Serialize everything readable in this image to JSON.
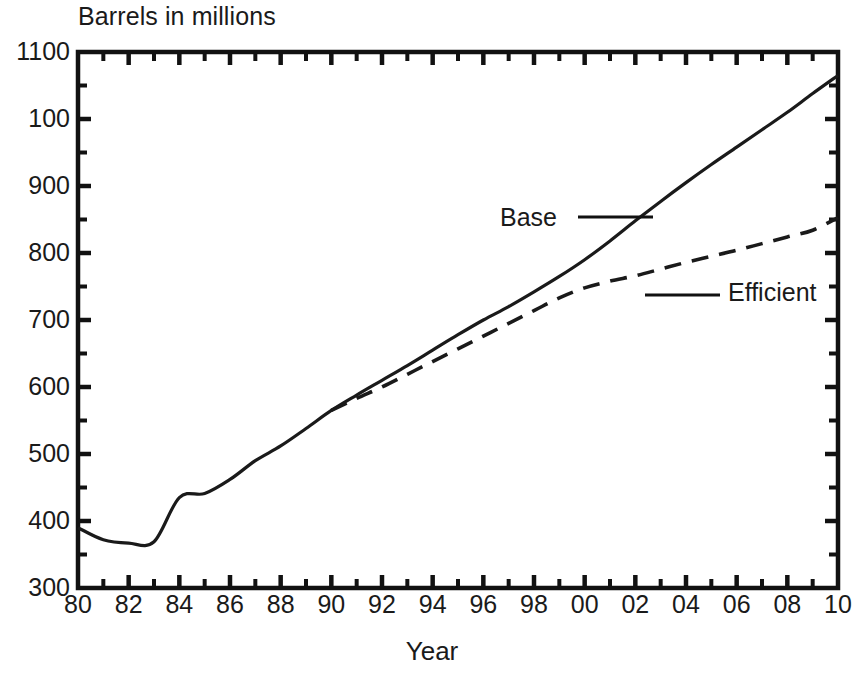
{
  "chart_data": {
    "type": "line",
    "title": "",
    "ylabel": "Barrels in millions",
    "xlabel": "Year",
    "grid": false,
    "legend_position": "inline-annotations",
    "xlim": [
      1980,
      2010
    ],
    "ylim": [
      300,
      1100
    ],
    "y_ticks": [
      1100,
      100,
      900,
      800,
      700,
      600,
      500,
      400,
      300
    ],
    "y_tick_values": [
      1100,
      1000,
      900,
      800,
      700,
      600,
      500,
      400,
      300
    ],
    "y_minor_ticks_per_interval": 1,
    "x_ticks": [
      "80",
      "82",
      "84",
      "86",
      "88",
      "90",
      "92",
      "94",
      "96",
      "98",
      "00",
      "02",
      "04",
      "06",
      "08",
      "10"
    ],
    "x_tick_values": [
      1980,
      1982,
      1984,
      1986,
      1988,
      1990,
      1992,
      1994,
      1996,
      1998,
      2000,
      2002,
      2004,
      2006,
      2008,
      2010
    ],
    "x_minor_ticks_per_interval": 1,
    "series": [
      {
        "name": "Base",
        "style": "solid",
        "color": "#1a1a1a",
        "x": [
          1980,
          1981,
          1982,
          1983,
          1984,
          1985,
          1986,
          1987,
          1988,
          1989,
          1990,
          1991,
          1992,
          1993,
          1994,
          1995,
          1996,
          1997,
          1998,
          1999,
          2000,
          2001,
          2002,
          2003,
          2004,
          2005,
          2006,
          2007,
          2008,
          2009,
          2010
        ],
        "values": [
          390,
          372,
          367,
          369,
          435,
          441,
          462,
          490,
          512,
          538,
          565,
          588,
          610,
          632,
          655,
          678,
          700,
          720,
          742,
          765,
          790,
          818,
          848,
          877,
          905,
          932,
          958,
          984,
          1010,
          1038,
          1065
        ]
      },
      {
        "name": "Efficient",
        "style": "dashed",
        "color": "#1a1a1a",
        "x": [
          1990,
          1991,
          1992,
          1993,
          1994,
          1995,
          1996,
          1997,
          1998,
          1999,
          2000,
          2001,
          2002,
          2003,
          2004,
          2005,
          2006,
          2007,
          2008,
          2009,
          2010
        ],
        "values": [
          565,
          583,
          600,
          619,
          638,
          657,
          676,
          695,
          714,
          733,
          748,
          758,
          766,
          776,
          786,
          795,
          804,
          814,
          824,
          834,
          853
        ]
      }
    ],
    "annotations": [
      {
        "text": "Base",
        "label_x": 500,
        "label_y": 205,
        "leader_from_x": 578,
        "leader_from_y": 217,
        "leader_to_x": 653,
        "leader_to_y": 217
      },
      {
        "text": "Efficient",
        "label_x": 728,
        "label_y": 280,
        "leader_from_x": 645,
        "leader_from_y": 295,
        "leader_to_x": 720,
        "leader_to_y": 295
      }
    ]
  }
}
